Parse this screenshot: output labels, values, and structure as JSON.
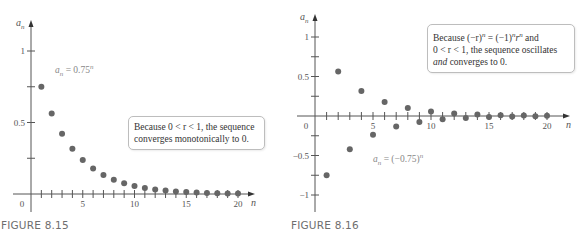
{
  "chart_data": [
    {
      "type": "scatter",
      "figure": "FIGURE 8.15",
      "formula_label": "a_n = 0.75^n",
      "annotation": "Because 0 < r < 1, the sequence converges monotonically to 0.",
      "xlabel": "n",
      "ylabel": "a_n",
      "xlim": [
        0,
        21
      ],
      "ylim": [
        -0.05,
        1.2
      ],
      "x_ticks": [
        0,
        5,
        10,
        15,
        20
      ],
      "y_ticks": [
        0.5,
        1
      ],
      "x": [
        1,
        2,
        3,
        4,
        5,
        6,
        7,
        8,
        9,
        10,
        11,
        12,
        13,
        14,
        15,
        16,
        17,
        18,
        19,
        20
      ],
      "values": [
        0.75,
        0.5625,
        0.4219,
        0.3164,
        0.2373,
        0.178,
        0.1335,
        0.1001,
        0.0751,
        0.0563,
        0.0422,
        0.0317,
        0.0238,
        0.0178,
        0.0134,
        0.01,
        0.0075,
        0.0056,
        0.0042,
        0.0032
      ],
      "grid": false,
      "marker_color": "#666666"
    },
    {
      "type": "scatter",
      "figure": "FIGURE 8.16",
      "formula_label": "a_n = (−0.75)^n",
      "annotation": "Because (−r)^n = (−1)^n r^n and 0 < r < 1, the sequence oscillates and converges to 0.",
      "xlabel": "n",
      "ylabel": "a_n",
      "xlim": [
        0,
        21
      ],
      "ylim": [
        -1.2,
        1.2
      ],
      "x_ticks": [
        0,
        5,
        10,
        15,
        20
      ],
      "y_ticks": [
        -1,
        -0.5,
        0.5,
        1
      ],
      "x": [
        1,
        2,
        3,
        4,
        5,
        6,
        7,
        8,
        9,
        10,
        11,
        12,
        13,
        14,
        15,
        16,
        17,
        18,
        19,
        20
      ],
      "values": [
        -0.75,
        0.5625,
        -0.4219,
        0.3164,
        -0.2373,
        0.178,
        -0.1335,
        0.1001,
        -0.0751,
        0.0563,
        -0.0422,
        0.0317,
        -0.0238,
        0.0178,
        -0.0134,
        0.01,
        -0.0075,
        0.0056,
        -0.0042,
        0.0032
      ],
      "grid": false,
      "marker_color": "#666666"
    }
  ],
  "left": {
    "caption": "FIGURE 8.15",
    "ylabel_main": "a",
    "ylabel_sub": "n",
    "xlabel": "n",
    "origin_label": "0",
    "x_tick_labels": [
      "5",
      "10",
      "15",
      "20"
    ],
    "y_tick_labels": [
      "1",
      "0.5"
    ],
    "formula": {
      "a": "a",
      "sub": "n",
      "rest": " = 0.75",
      "sup": "n"
    },
    "note": {
      "line1": "Because 0 < r < 1, the sequence",
      "line2": "converges monotonically to 0."
    }
  },
  "right": {
    "caption": "FIGURE 8.16",
    "ylabel_main": "a",
    "ylabel_sub": "n",
    "xlabel": "n",
    "origin_label": "0",
    "x_tick_labels": [
      "5",
      "10",
      "15",
      "20"
    ],
    "y_tick_labels": [
      "1",
      "0.5",
      "−0.5",
      "−1"
    ],
    "formula": {
      "a": "a",
      "sub": "n",
      "rest": " = (−0.75)",
      "sup": "n"
    },
    "note": {
      "p1": "Because (−r)",
      "p1sup": "n",
      "p2": " = (−1)",
      "p2sup": "n",
      "p3": "r",
      "p3sup": "n",
      "p4": " and",
      "line2": "0 < r < 1, the sequence oscillates",
      "line3_em": "and",
      "line3_rest": " converges to 0."
    }
  }
}
